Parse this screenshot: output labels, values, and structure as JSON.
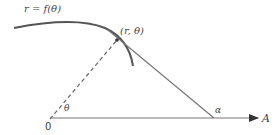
{
  "diagram": {
    "labels": {
      "curve": "r = f(θ)",
      "point": "(r, θ)",
      "origin": "0",
      "theta": "θ",
      "alpha": "α",
      "axis": "A"
    },
    "colors": {
      "curve": "#555555",
      "line": "#777777",
      "text": "#444444"
    },
    "points": {
      "origin": [
        50,
        119
      ],
      "curve_point": [
        117,
        40
      ],
      "tangent_axis_intersection": [
        214,
        118
      ],
      "axis_end": [
        258,
        118
      ]
    }
  }
}
